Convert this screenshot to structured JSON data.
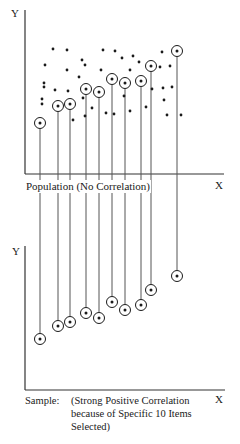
{
  "chart_data": [
    {
      "type": "scatter",
      "title": "Population (No Correlation)",
      "xlabel": "X",
      "ylabel": "Y",
      "grid": false,
      "note": "Coordinates in image pixels; 10 circled points are the selected sample, dropped by vertical lines to the lower chart",
      "selected_points": [
        {
          "x": 40,
          "y": 123
        },
        {
          "x": 58,
          "y": 106
        },
        {
          "x": 70,
          "y": 104
        },
        {
          "x": 86,
          "y": 89
        },
        {
          "x": 99,
          "y": 92
        },
        {
          "x": 112,
          "y": 79
        },
        {
          "x": 125,
          "y": 83
        },
        {
          "x": 141,
          "y": 81
        },
        {
          "x": 151,
          "y": 66
        },
        {
          "x": 177,
          "y": 51
        }
      ],
      "other_points": [
        {
          "x": 53,
          "y": 49
        },
        {
          "x": 67,
          "y": 50
        },
        {
          "x": 103,
          "y": 50
        },
        {
          "x": 115,
          "y": 51
        },
        {
          "x": 45,
          "y": 65
        },
        {
          "x": 82,
          "y": 60
        },
        {
          "x": 85,
          "y": 65
        },
        {
          "x": 122,
          "y": 58
        },
        {
          "x": 133,
          "y": 56
        },
        {
          "x": 139,
          "y": 62
        },
        {
          "x": 162,
          "y": 52
        },
        {
          "x": 67,
          "y": 70
        },
        {
          "x": 101,
          "y": 70
        },
        {
          "x": 130,
          "y": 70
        },
        {
          "x": 79,
          "y": 77
        },
        {
          "x": 44,
          "y": 83
        },
        {
          "x": 44,
          "y": 87
        },
        {
          "x": 55,
          "y": 90
        },
        {
          "x": 68,
          "y": 91
        },
        {
          "x": 160,
          "y": 67
        },
        {
          "x": 170,
          "y": 66
        },
        {
          "x": 152,
          "y": 89
        },
        {
          "x": 163,
          "y": 88
        },
        {
          "x": 172,
          "y": 87
        },
        {
          "x": 83,
          "y": 98
        },
        {
          "x": 124,
          "y": 96
        },
        {
          "x": 42,
          "y": 99
        },
        {
          "x": 42,
          "y": 104
        },
        {
          "x": 164,
          "y": 100
        },
        {
          "x": 92,
          "y": 108
        },
        {
          "x": 73,
          "y": 120
        },
        {
          "x": 85,
          "y": 116
        },
        {
          "x": 106,
          "y": 113
        },
        {
          "x": 114,
          "y": 114
        },
        {
          "x": 130,
          "y": 111
        },
        {
          "x": 146,
          "y": 107
        },
        {
          "x": 167,
          "y": 115
        },
        {
          "x": 181,
          "y": 115
        }
      ]
    },
    {
      "type": "scatter",
      "title": "Sample: (Strong Positive Correlation because of Specific 10 Items Selected)",
      "xlabel": "X",
      "ylabel": "Y",
      "grid": false,
      "points": [
        {
          "x": 40,
          "y": 339
        },
        {
          "x": 58,
          "y": 326
        },
        {
          "x": 70,
          "y": 322
        },
        {
          "x": 86,
          "y": 313
        },
        {
          "x": 99,
          "y": 318
        },
        {
          "x": 112,
          "y": 302
        },
        {
          "x": 125,
          "y": 310
        },
        {
          "x": 141,
          "y": 305
        },
        {
          "x": 151,
          "y": 290
        },
        {
          "x": 177,
          "y": 276
        }
      ]
    }
  ],
  "top_chart": {
    "y_label": "Y",
    "x_label": "X",
    "caption": "Population (No Correlation)"
  },
  "bottom_chart": {
    "y_label": "Y",
    "x_label": "X",
    "caption_prefix": "Sample:",
    "caption_line1": "(Strong Positive Correlation",
    "caption_line2": "because of Specific 10 Items",
    "caption_line3": "Selected)"
  },
  "colors": {
    "ink": "#1a1a1a",
    "line": "#555555",
    "background": "#ffffff"
  }
}
